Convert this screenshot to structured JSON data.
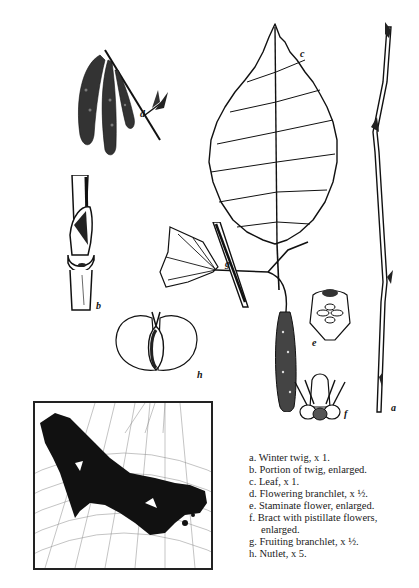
{
  "plate": {
    "subject": "Birch botanical illustration plate",
    "figure_labels": {
      "a": "a",
      "b": "b",
      "c": "c",
      "d": "d",
      "e": "e",
      "f": "f",
      "g": "g",
      "h": "h"
    },
    "legend": [
      {
        "key": "a.",
        "text": "Winter twig, x 1."
      },
      {
        "key": "b.",
        "text": "Portion of twig, enlarged."
      },
      {
        "key": "c.",
        "text": "Leaf, x 1."
      },
      {
        "key": "d.",
        "text": "Flowering branchlet, x ½."
      },
      {
        "key": "e.",
        "text": "Staminate flower, enlarged."
      },
      {
        "key": "f.",
        "text": "Bract with pistillate flowers,"
      },
      {
        "key": "",
        "text": "enlarged."
      },
      {
        "key": "g.",
        "text": "Fruiting branchlet, x ½."
      },
      {
        "key": "h.",
        "text": "Nutlet, x 5."
      }
    ],
    "map": {
      "description": "Range map of North America with shaded distribution across Canada and northern United States"
    },
    "colors": {
      "ink": "#111111",
      "paper": "#ffffff"
    }
  }
}
